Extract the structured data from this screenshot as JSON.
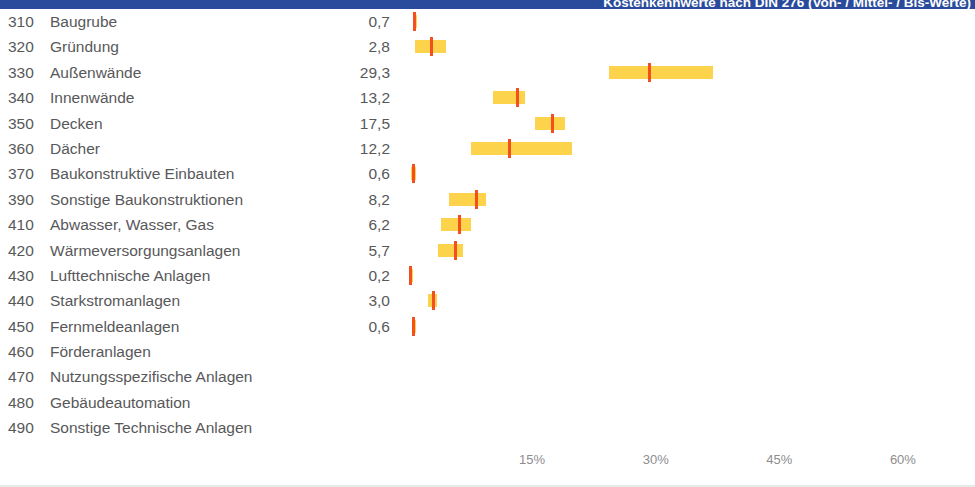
{
  "header": {
    "title": "Kostenkennwerte nach DIN 276 (Von- / Mittel- / Bis-Werte)",
    "bar_color": "#2a4b9b"
  },
  "colors": {
    "range_bar": "#fcd34a",
    "median_mark": "#f4501e",
    "text": "#58585a",
    "axis_text": "#8d8d8f"
  },
  "axis": {
    "ticks": [
      {
        "label": "15%",
        "value": 15
      },
      {
        "label": "30%",
        "value": 30
      },
      {
        "label": "45%",
        "value": 45
      },
      {
        "label": "60%",
        "value": 60
      }
    ]
  },
  "chart_data": {
    "type": "bar",
    "title": "Kostenkennwerte nach DIN 276 (Von- / Mittel- / Bis-Werte)",
    "xlabel": "",
    "ylabel": "",
    "xlim": [
      0,
      64
    ],
    "grid": false,
    "legend": null,
    "categories": [
      "Baugrube",
      "Gründung",
      "Außenwände",
      "Innenwände",
      "Decken",
      "Dächer",
      "Baukonstruktive Einbauten",
      "Sonstige Baukonstruktionen",
      "Abwasser, Wasser, Gas",
      "Wärmeversorgungsanlagen",
      "Lufttechnische Anlagen",
      "Starkstromanlagen",
      "Fernmeldeanlagen",
      "Förderanlagen",
      "Nutzungsspezifische Anlagen",
      "Gebäudeautomation",
      "Sonstige Technische Anlagen"
    ],
    "codes": [
      "310",
      "320",
      "330",
      "340",
      "350",
      "360",
      "370",
      "390",
      "410",
      "420",
      "430",
      "440",
      "450",
      "460",
      "470",
      "480",
      "490"
    ],
    "values": [
      0.7,
      2.8,
      29.3,
      13.2,
      17.5,
      12.2,
      0.6,
      8.2,
      6.2,
      5.7,
      0.2,
      3.0,
      0.6,
      null,
      null,
      null,
      null
    ],
    "low": [
      0.5,
      0.8,
      24.3,
      10.3,
      15.3,
      7.6,
      0.3,
      4.9,
      3.9,
      3.6,
      0.1,
      2.4,
      0.4,
      null,
      null,
      null,
      null
    ],
    "high": [
      0.9,
      4.5,
      36.9,
      14.2,
      19.0,
      19.8,
      0.9,
      9.4,
      7.6,
      6.6,
      0.4,
      3.4,
      0.8,
      null,
      null,
      null,
      null
    ]
  },
  "rows": [
    {
      "code": "310",
      "label": "Baugrube",
      "value": "0,7",
      "low": 0.5,
      "mid": 0.7,
      "high": 0.9
    },
    {
      "code": "320",
      "label": "Gründung",
      "value": "2,8",
      "low": 0.8,
      "mid": 2.8,
      "high": 4.5
    },
    {
      "code": "330",
      "label": "Außenwände",
      "value": "29,3",
      "low": 24.3,
      "mid": 29.3,
      "high": 36.9
    },
    {
      "code": "340",
      "label": "Innenwände",
      "value": "13,2",
      "low": 10.3,
      "mid": 13.2,
      "high": 14.2
    },
    {
      "code": "350",
      "label": "Decken",
      "value": "17,5",
      "low": 15.3,
      "mid": 17.5,
      "high": 19.0
    },
    {
      "code": "360",
      "label": "Dächer",
      "value": "12,2",
      "low": 7.6,
      "mid": 12.2,
      "high": 19.8
    },
    {
      "code": "370",
      "label": "Baukonstruktive Einbauten",
      "value": "0,6",
      "low": 0.3,
      "mid": 0.6,
      "high": 0.9
    },
    {
      "code": "390",
      "label": "Sonstige Baukonstruktionen",
      "value": "8,2",
      "low": 4.9,
      "mid": 8.2,
      "high": 9.4
    },
    {
      "code": "410",
      "label": "Abwasser, Wasser, Gas",
      "value": "6,2",
      "low": 3.9,
      "mid": 6.2,
      "high": 7.6
    },
    {
      "code": "420",
      "label": "Wärmeversorgungsanlagen",
      "value": "5,7",
      "low": 3.6,
      "mid": 5.7,
      "high": 6.6
    },
    {
      "code": "430",
      "label": "Lufttechnische Anlagen",
      "value": "0,2",
      "low": 0.1,
      "mid": 0.2,
      "high": 0.4
    },
    {
      "code": "440",
      "label": "Starkstromanlagen",
      "value": "3,0",
      "low": 2.4,
      "mid": 3.0,
      "high": 3.4
    },
    {
      "code": "450",
      "label": "Fernmeldeanlagen",
      "value": "0,6",
      "low": 0.4,
      "mid": 0.6,
      "high": 0.8
    },
    {
      "code": "460",
      "label": "Förderanlagen",
      "value": "",
      "low": null,
      "mid": null,
      "high": null
    },
    {
      "code": "470",
      "label": "Nutzungsspezifische Anlagen",
      "value": "",
      "low": null,
      "mid": null,
      "high": null
    },
    {
      "code": "480",
      "label": "Gebäudeautomation",
      "value": "",
      "low": null,
      "mid": null,
      "high": null
    },
    {
      "code": "490",
      "label": "Sonstige Technische Anlagen",
      "value": "",
      "low": null,
      "mid": null,
      "high": null
    }
  ]
}
